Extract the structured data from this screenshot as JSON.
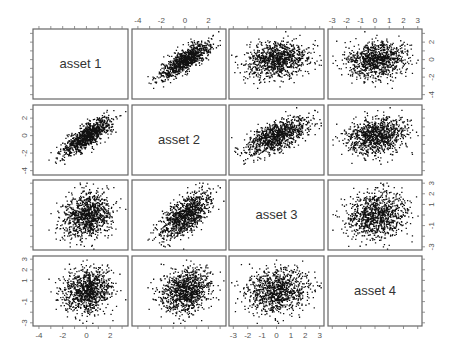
{
  "chart_data": {
    "type": "scatter",
    "subtype": "scatterplot-matrix",
    "title": "",
    "variables": [
      "asset 1",
      "asset 2",
      "asset 3",
      "asset 4"
    ],
    "n_points_per_panel": 1000,
    "correlation_matrix": [
      [
        1.0,
        0.8,
        0.15,
        0.1
      ],
      [
        0.8,
        1.0,
        0.6,
        0.2
      ],
      [
        0.15,
        0.6,
        1.0,
        0.15
      ],
      [
        0.1,
        0.2,
        0.15,
        1.0
      ]
    ],
    "axis_ranges": [
      [
        -4.5,
        3.5
      ],
      [
        -4.5,
        3.5
      ],
      [
        -3.3,
        3.3
      ],
      [
        -3.3,
        3.3
      ]
    ],
    "tick_labels": {
      "top_col2": [
        "-4",
        "-2",
        "0",
        "2"
      ],
      "top_col4": [
        "-3",
        "-2",
        "-1",
        "0",
        "1",
        "2",
        "3"
      ],
      "right_row1": [
        "2",
        "0",
        "-2",
        "-4"
      ],
      "right_row3": [
        "3",
        "2",
        "1",
        "-1",
        "-3"
      ],
      "left_row2": [
        "2",
        "0",
        "-2",
        "-4"
      ],
      "left_row4": [
        "3",
        "2",
        "1",
        "-1",
        "-3"
      ],
      "bottom_col1": [
        "-4",
        "-2",
        "0",
        "2"
      ],
      "bottom_col3": [
        "-3",
        "-2",
        "-1",
        "0",
        "1",
        "2",
        "3"
      ]
    },
    "grid": false,
    "legend": null
  },
  "layout": {
    "col_x": [
      [
        33,
        128
      ],
      [
        132,
        226
      ],
      [
        229,
        324
      ],
      [
        328,
        422
      ]
    ],
    "row_y": [
      [
        29,
        99
      ],
      [
        105,
        175
      ],
      [
        180,
        250
      ],
      [
        256,
        326
      ]
    ],
    "point_color": "#111111",
    "frame_color": "#666666"
  },
  "labels": {
    "asset1": "asset 1",
    "asset2": "asset 2",
    "asset3": "asset 3",
    "asset4": "asset 4"
  }
}
